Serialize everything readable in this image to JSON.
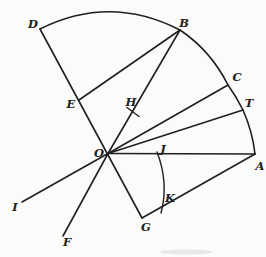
{
  "diagram": {
    "ink_color": "#1f1f1f",
    "paper_color": "#fbfbfa",
    "labels": [
      {
        "text": "D",
        "x": 33,
        "y": 28
      },
      {
        "text": "B",
        "x": 184,
        "y": 27
      },
      {
        "text": "C",
        "x": 237,
        "y": 81
      },
      {
        "text": "T",
        "x": 249,
        "y": 107
      },
      {
        "text": "E",
        "x": 71,
        "y": 108
      },
      {
        "text": "H",
        "x": 131,
        "y": 106
      },
      {
        "text": "O",
        "x": 99,
        "y": 157
      },
      {
        "text": "J",
        "x": 163,
        "y": 153
      },
      {
        "text": "A",
        "x": 260,
        "y": 170
      },
      {
        "text": "G",
        "x": 146,
        "y": 231
      },
      {
        "text": "K",
        "x": 170,
        "y": 202
      },
      {
        "text": "I",
        "x": 15,
        "y": 211
      },
      {
        "text": "F",
        "x": 67,
        "y": 246
      }
    ]
  }
}
